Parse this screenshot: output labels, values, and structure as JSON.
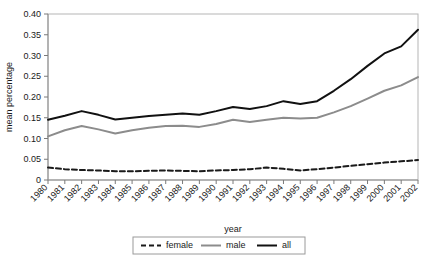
{
  "chart_data": {
    "type": "line",
    "title": "",
    "xlabel": "year",
    "ylabel": "mean percentage",
    "x": [
      1980,
      1981,
      1982,
      1983,
      1984,
      1985,
      1986,
      1987,
      1988,
      1989,
      1990,
      1991,
      1992,
      1993,
      1994,
      1995,
      1996,
      1997,
      1998,
      1999,
      2000,
      2001,
      2002
    ],
    "categories": [
      "1980",
      "1981",
      "1982",
      "1983",
      "1984",
      "1985",
      "1986",
      "1987",
      "1988",
      "1989",
      "1990",
      "1991",
      "1992",
      "1993",
      "1994",
      "1995",
      "1996",
      "1997",
      "1998",
      "1999",
      "2000",
      "2001",
      "2002"
    ],
    "xlim": [
      1980,
      2002
    ],
    "ylim": [
      0,
      0.4
    ],
    "yticks": [
      0,
      0.05,
      0.1,
      0.15,
      0.2,
      0.25,
      0.3,
      0.35,
      0.4
    ],
    "ytick_labels": [
      "0",
      "0.05",
      "0.10",
      "0.15",
      "0.20",
      "0.25",
      "0.30",
      "0.35",
      "0.40"
    ],
    "grid": false,
    "legend_position": "bottom",
    "series": [
      {
        "name": "female",
        "style": "dashed",
        "color": "#1a1a1a",
        "width": 2,
        "dash": "5,3",
        "values": [
          0.03,
          0.026,
          0.024,
          0.023,
          0.021,
          0.021,
          0.022,
          0.023,
          0.022,
          0.021,
          0.023,
          0.024,
          0.026,
          0.03,
          0.027,
          0.023,
          0.026,
          0.03,
          0.034,
          0.038,
          0.042,
          0.045,
          0.048
        ]
      },
      {
        "name": "male",
        "style": "solid",
        "color": "#8c8c8c",
        "width": 2,
        "dash": "",
        "values": [
          0.105,
          0.12,
          0.13,
          0.122,
          0.112,
          0.12,
          0.126,
          0.13,
          0.131,
          0.128,
          0.135,
          0.145,
          0.14,
          0.145,
          0.15,
          0.148,
          0.15,
          0.163,
          0.178,
          0.196,
          0.215,
          0.228,
          0.248
        ]
      },
      {
        "name": "all",
        "style": "solid",
        "color": "#111111",
        "width": 2,
        "dash": "",
        "values": [
          0.145,
          0.155,
          0.166,
          0.157,
          0.146,
          0.15,
          0.154,
          0.157,
          0.16,
          0.157,
          0.166,
          0.176,
          0.171,
          0.178,
          0.19,
          0.183,
          0.19,
          0.215,
          0.243,
          0.275,
          0.305,
          0.322,
          0.362
        ]
      }
    ]
  },
  "legend": {
    "items": [
      {
        "label": "female"
      },
      {
        "label": "male"
      },
      {
        "label": "all"
      }
    ]
  }
}
